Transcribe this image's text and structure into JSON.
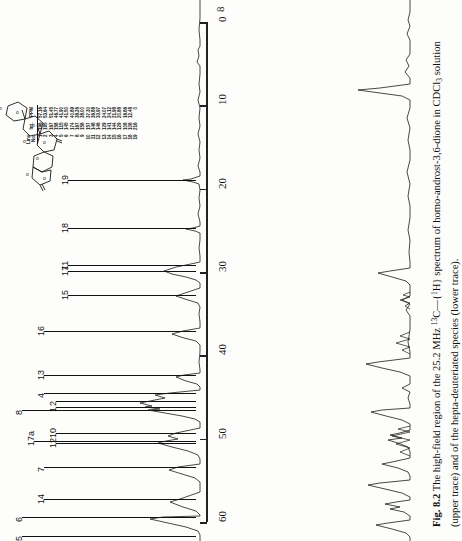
{
  "figure": {
    "number": "8.2",
    "page_marker": "8",
    "caption_prefix": "Fig. 8.2",
    "caption_text": "The high-field region of the 25.2 MHz 13C—{1H} spectrum of homo-androst-3,6-dione in CDCl3 solution (upper trace) and of the hepta-deuteriated species (lower trace).",
    "caption_parts": {
      "p1": "The high-field region of the 25.2 MHz ",
      "nuc1_sup": "13",
      "nuc1": "C",
      "dash": "—{",
      "nuc2_sup": "1",
      "nuc2": "H",
      "p2": "} spectrum of homo-androst-3,6-dione in CDCl",
      "solvent_sub": "3",
      "p3": " solution (upper trace) and of the hepta-deuteriated species (lower trace)."
    }
  },
  "axis": {
    "unit": "ppm",
    "min": 0,
    "max": 60,
    "direction": "0 at top, 60 at bottom",
    "tick_labels": [
      "0",
      "10",
      "20",
      "30",
      "40",
      "50",
      "60"
    ],
    "tick_values": [
      0,
      10,
      20,
      30,
      40,
      50,
      60
    ]
  },
  "line_table": {
    "headers": [
      "Line No.",
      "Int.",
      "PPM"
    ],
    "header_parts": {
      "line": "Line",
      "no": "No.",
      "int": "Int.",
      "ppm": "PPM"
    },
    "rows": [
      {
        "no": "1",
        "int": "196",
        "ppm": "57.16"
      },
      {
        "no": "2",
        "int": "185",
        "ppm": "53.64"
      },
      {
        "no": "3",
        "int": "167",
        "ppm": "51.45"
      },
      {
        "no": "4",
        "int": "158",
        "ppm": "46.77"
      },
      {
        "no": "5",
        "int": "115",
        "ppm": "41.90"
      },
      {
        "no": "6",
        "int": "145",
        "ppm": "41.50"
      },
      {
        "no": "7",
        "int": "174",
        "ppm": "40.89"
      },
      {
        "no": "8",
        "int": "167",
        "ppm": "38.26"
      },
      {
        "no": "9",
        "int": "158",
        "ppm": "38.00"
      },
      {
        "no": "10",
        "int": "157",
        "ppm": "37.30"
      },
      {
        "no": "11",
        "int": "148",
        "ppm": "36.88"
      },
      {
        "no": "12",
        "int": "146",
        "ppm": "33.97"
      },
      {
        "no": "13",
        "int": "129",
        "ppm": "24.07"
      },
      {
        "no": "14",
        "int": "141",
        "ppm": "24.12"
      },
      {
        "no": "15",
        "int": "144",
        "ppm": "21.98"
      },
      {
        "no": "16",
        "int": "129",
        "ppm": "20.88"
      },
      {
        "no": "17",
        "int": "108",
        "ppm": "16.86"
      },
      {
        "no": "18",
        "int": "108",
        "ppm": "12.48"
      },
      {
        "no": "19",
        "int": "216",
        "ppm": "0"
      }
    ]
  },
  "assignments": [
    {
      "label": "19",
      "y": 180
    },
    {
      "label": "18",
      "y": 228
    },
    {
      "label": "17",
      "y": 271
    },
    {
      "label": "11",
      "y": 265
    },
    {
      "label": "15",
      "y": 295
    },
    {
      "label": "16",
      "y": 331
    },
    {
      "label": "13",
      "y": 375
    },
    {
      "label": "4",
      "y": 393
    },
    {
      "label": "2",
      "y": 401
    },
    {
      "label": "1",
      "y": 407
    },
    {
      "label": "8",
      "y": 410
    },
    {
      "label": "10",
      "y": 433
    },
    {
      "label": "17a",
      "y": 441
    },
    {
      "label": "12",
      "y": 443
    },
    {
      "label": "7",
      "y": 467
    },
    {
      "label": "14",
      "y": 499
    },
    {
      "label": "6",
      "y": 517
    },
    {
      "label": "5",
      "y": 536
    }
  ],
  "traces": {
    "upper": {
      "name": "upper trace",
      "description": "protiated homo-androst-3,6-dione"
    },
    "lower": {
      "name": "lower trace",
      "description": "hepta-deuteriated species"
    }
  },
  "structure": {
    "name": "homo-androst-3,6-dione skeleton",
    "oxygen_labels": [
      "O",
      "O"
    ]
  },
  "colors": {
    "ink": "#111111",
    "paper": "#fdfdfb",
    "trace": "#1a1a1a"
  }
}
